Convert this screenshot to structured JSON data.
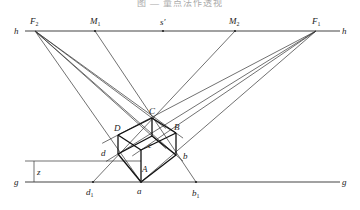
{
  "caption": "图 — 量点法作透视",
  "lines": {
    "horizon_label_left": "h",
    "horizon_label_right": "h",
    "ground_label_left": "g",
    "ground_label_right": "g",
    "height_label": "z"
  },
  "points": {
    "F2": "F2",
    "M1": "M1",
    "s_prime": "s′",
    "M2": "M2",
    "F1": "F1",
    "C": "C",
    "D": "D",
    "B": "B",
    "c": "c",
    "d": "d",
    "b": "b",
    "A": "A",
    "a": "a",
    "d1": "d1",
    "b1": "b1"
  },
  "label_parts": {
    "F2": [
      "F",
      "2"
    ],
    "M1": [
      "M",
      "1"
    ],
    "M2": [
      "M",
      "2"
    ],
    "F1": [
      "F",
      "1"
    ],
    "d1": [
      "d",
      "1"
    ],
    "b1": [
      "b",
      "1"
    ]
  }
}
